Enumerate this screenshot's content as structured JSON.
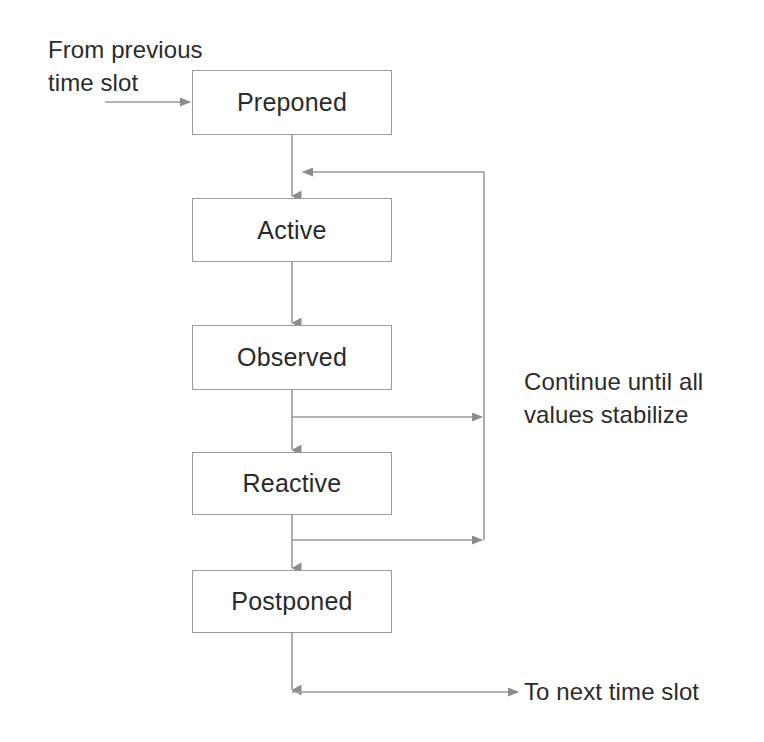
{
  "diagram": {
    "stroke_color": "#9a9a9a",
    "text_color": "#2b2b2b",
    "background_color": "#ffffff",
    "states": [
      {
        "id": "preponed",
        "label": "Preponed"
      },
      {
        "id": "active",
        "label": "Active"
      },
      {
        "id": "observed",
        "label": "Observed"
      },
      {
        "id": "reactive",
        "label": "Reactive"
      },
      {
        "id": "postponed",
        "label": "Postponed"
      }
    ],
    "annotations": [
      {
        "id": "from-previous",
        "label": "From previous\ntime slot"
      },
      {
        "id": "continue-until",
        "label": "Continue until all\nvalues stabilize"
      },
      {
        "id": "to-next",
        "label": "To next time slot"
      }
    ],
    "connections": [
      {
        "id": "entry",
        "from": "From previous time slot",
        "to": "Preponed",
        "kind": "input-arrow"
      },
      {
        "id": "preponed-to-active",
        "from": "Preponed",
        "to": "Active",
        "kind": "down-arrow"
      },
      {
        "id": "active-to-observed",
        "from": "Active",
        "to": "Observed",
        "kind": "down-arrow"
      },
      {
        "id": "observed-to-reactive",
        "from": "Observed",
        "to": "Reactive",
        "kind": "down-arrow"
      },
      {
        "id": "reactive-to-postponed",
        "from": "Reactive",
        "to": "Postponed",
        "kind": "down-arrow"
      },
      {
        "id": "observed-feedback",
        "from": "Observed",
        "to": "Active",
        "kind": "feedback-loop"
      },
      {
        "id": "reactive-feedback",
        "from": "Reactive",
        "to": "Active",
        "kind": "feedback-loop"
      },
      {
        "id": "exit",
        "from": "Postponed",
        "to": "To next time slot",
        "kind": "output-arrow"
      }
    ]
  }
}
